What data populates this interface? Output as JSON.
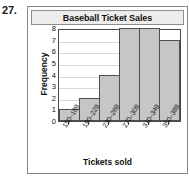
{
  "problem": {
    "number": "27."
  },
  "chart_data": {
    "type": "bar",
    "title": "Baseball Ticket Sales",
    "xlabel": "Tickets sold",
    "ylabel": "Frequency",
    "categories": [
      "150–189",
      "190–229",
      "230–269",
      "270–309",
      "310–349",
      "350–389"
    ],
    "values": [
      1,
      2,
      4,
      8,
      8,
      7
    ],
    "ylim": [
      0,
      8
    ],
    "yticks": [
      0,
      1,
      2,
      3,
      4,
      5,
      6,
      7,
      8
    ],
    "ytick_labels": [
      "0",
      "1",
      "2",
      "3",
      "4",
      "5",
      "6",
      "7",
      "8"
    ],
    "grid": true,
    "legend": false
  }
}
